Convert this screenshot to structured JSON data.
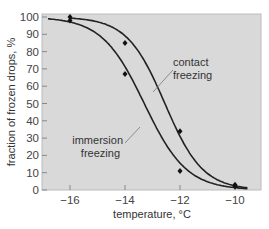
{
  "chart_data": {
    "type": "line",
    "title": "",
    "xlabel": "temperature, °C",
    "ylabel": "fraction of frozen drops, %",
    "xlim": [
      -17,
      -9.3
    ],
    "ylim": [
      0,
      100
    ],
    "x_ticks": [
      "−16",
      "−14",
      "−12",
      "−10"
    ],
    "y_ticks": [
      "0",
      "10",
      "20",
      "30",
      "40",
      "50",
      "60",
      "70",
      "80",
      "90",
      "100"
    ],
    "grid": false,
    "background": "#d9d9d9",
    "series": [
      {
        "name": "contact freezing",
        "points": [
          [
            -16,
            100
          ],
          [
            -14,
            85
          ],
          [
            -12,
            34
          ],
          [
            -10,
            3
          ]
        ],
        "curve": "sigmoid fit"
      },
      {
        "name": "immersion freezing",
        "points": [
          [
            -16,
            98
          ],
          [
            -14,
            67
          ],
          [
            -12,
            11
          ],
          [
            -10,
            2
          ]
        ],
        "curve": "sigmoid fit"
      }
    ],
    "annotations": [
      {
        "text": [
          "contact",
          "freezing"
        ],
        "target": "contact freezing curve"
      },
      {
        "text": [
          "immersion",
          "freezing"
        ],
        "target": "immersion freezing curve"
      }
    ]
  }
}
